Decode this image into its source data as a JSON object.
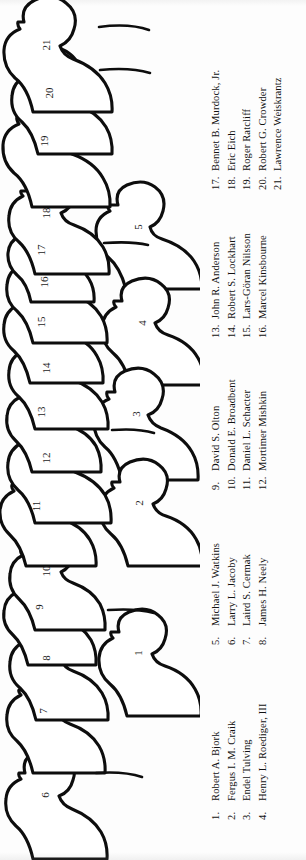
{
  "document": {
    "kind": "group-photograph-key",
    "orientation": "rotated-90-counterclockwise",
    "background_color": "#fdfdfd",
    "ink_color": "#0d0d0d"
  },
  "figure": {
    "back_row_label": "back row",
    "front_row_label": "front row",
    "back_row_numbers": [
      "6",
      "7",
      "8",
      "9",
      "10",
      "11",
      "12",
      "13",
      "14",
      "15",
      "16",
      "17",
      "18",
      "19",
      "20",
      "21"
    ],
    "front_row_numbers": [
      "1",
      "2",
      "3",
      "4",
      "5"
    ],
    "heads": [
      {
        "number": "6",
        "row": "back",
        "cx": 46,
        "cy": 795,
        "rx": 21,
        "ry": 24
      },
      {
        "number": "7",
        "row": "back",
        "cx": 44,
        "cy": 711,
        "rx": 20,
        "ry": 23
      },
      {
        "number": "8",
        "row": "back",
        "cx": 47,
        "cy": 658,
        "rx": 20,
        "ry": 23
      },
      {
        "number": "9",
        "row": "back",
        "cx": 40,
        "cy": 607,
        "rx": 19,
        "ry": 21
      },
      {
        "number": "10",
        "row": "back",
        "cx": 47,
        "cy": 571,
        "rx": 19,
        "ry": 22
      },
      {
        "number": "11",
        "row": "back",
        "cx": 37,
        "cy": 506,
        "rx": 20,
        "ry": 22
      },
      {
        "number": "12",
        "row": "back",
        "cx": 47,
        "cy": 458,
        "rx": 21,
        "ry": 24
      },
      {
        "number": "13",
        "row": "back",
        "cx": 42,
        "cy": 412,
        "rx": 19,
        "ry": 22
      },
      {
        "number": "14",
        "row": "back",
        "cx": 47,
        "cy": 368,
        "rx": 20,
        "ry": 23
      },
      {
        "number": "15",
        "row": "back",
        "cx": 42,
        "cy": 322,
        "rx": 20,
        "ry": 23
      },
      {
        "number": "16",
        "row": "back",
        "cx": 45,
        "cy": 282,
        "rx": 20,
        "ry": 23
      },
      {
        "number": "17",
        "row": "back",
        "cx": 42,
        "cy": 250,
        "rx": 18,
        "ry": 20
      },
      {
        "number": "18",
        "row": "back",
        "cx": 47,
        "cy": 213,
        "rx": 20,
        "ry": 23
      },
      {
        "number": "19",
        "row": "back",
        "cx": 45,
        "cy": 141,
        "rx": 22,
        "ry": 25
      },
      {
        "number": "20",
        "row": "back",
        "cx": 50,
        "cy": 93,
        "rx": 20,
        "ry": 23
      },
      {
        "number": "21",
        "row": "back",
        "cx": 47,
        "cy": 45,
        "rx": 22,
        "ry": 25
      },
      {
        "number": "1",
        "row": "front",
        "cx": 139,
        "cy": 653,
        "rx": 21,
        "ry": 23
      },
      {
        "number": "2",
        "row": "front",
        "cx": 140,
        "cy": 503,
        "rx": 21,
        "ry": 23
      },
      {
        "number": "3",
        "row": "front",
        "cx": 137,
        "cy": 414,
        "rx": 22,
        "ry": 24
      },
      {
        "number": "4",
        "row": "front",
        "cx": 143,
        "cy": 323,
        "rx": 21,
        "ry": 23
      },
      {
        "number": "5",
        "row": "front",
        "cx": 139,
        "cy": 227,
        "rx": 22,
        "ry": 24
      }
    ]
  },
  "legend": {
    "columns": [
      {
        "id": "legend-column-1",
        "entries": [
          {
            "number": "1.",
            "name": "Robert A. Bjork"
          },
          {
            "number": "2.",
            "name": "Fergus I. M. Craik"
          },
          {
            "number": "3.",
            "name": "Endel Tulving"
          },
          {
            "number": "4.",
            "name": "Henry L. Roediger, III"
          }
        ]
      },
      {
        "id": "legend-column-2",
        "entries": [
          {
            "number": "5.",
            "name": "Michael J. Watkins"
          },
          {
            "number": "6.",
            "name": "Larry L. Jacoby"
          },
          {
            "number": "7.",
            "name": "Laird S. Cermak"
          },
          {
            "number": "8.",
            "name": "James H. Neely"
          }
        ]
      },
      {
        "id": "legend-column-3",
        "entries": [
          {
            "number": "9.",
            "name": "David S. Olton"
          },
          {
            "number": "10.",
            "name": "Donald E. Broadbent"
          },
          {
            "number": "11.",
            "name": "Daniel L. Schacter"
          },
          {
            "number": "12.",
            "name": "Mortimer Mishkin"
          }
        ]
      },
      {
        "id": "legend-column-4",
        "entries": [
          {
            "number": "13.",
            "name": "John R. Anderson"
          },
          {
            "number": "14.",
            "name": "Robert S. Lockhart"
          },
          {
            "number": "15.",
            "name": "Lars-Göran Nilsson"
          },
          {
            "number": "16.",
            "name": "Marcel Kinsbourne"
          }
        ]
      },
      {
        "id": "legend-column-5",
        "entries": [
          {
            "number": "17.",
            "name": "Bennet B. Murdock, Jr."
          },
          {
            "number": "18.",
            "name": "Eric Eich"
          },
          {
            "number": "19.",
            "name": "Roger Ratcliff"
          },
          {
            "number": "20.",
            "name": "Robert G. Crowder"
          },
          {
            "number": "21.",
            "name": "Lawrence Weiskrantz"
          }
        ]
      }
    ]
  }
}
